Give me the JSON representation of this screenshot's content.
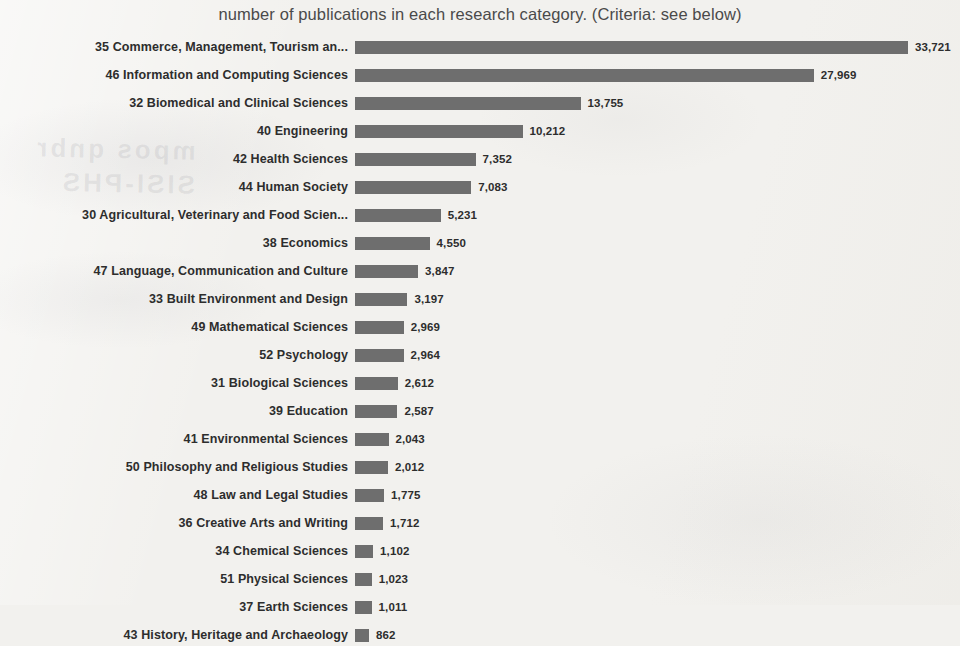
{
  "chart_data": {
    "type": "bar",
    "orientation": "horizontal",
    "title": "number of publications in each research category. (Criteria: see below)",
    "xlabel": "",
    "ylabel": "",
    "grid": false,
    "legend": null,
    "xlim": [
      0,
      33721
    ],
    "bar_color": "#6e6e6e",
    "background_color": "#f2f1ee",
    "text_color": "#2d2d2d",
    "sorted": "descending",
    "categories": [
      "35 Commerce, Management, Tourism an...",
      "46 Information and Computing Sciences",
      "32 Biomedical and Clinical Sciences",
      "40 Engineering",
      "42 Health Sciences",
      "44 Human Society",
      "30 Agricultural, Veterinary and Food Scien...",
      "38 Economics",
      "47 Language, Communication and Culture",
      "33 Built Environment and Design",
      "49 Mathematical Sciences",
      "52 Psychology",
      "31 Biological Sciences",
      "39 Education",
      "41 Environmental Sciences",
      "50 Philosophy and Religious Studies",
      "48 Law and Legal Studies",
      "36 Creative Arts and Writing",
      "34 Chemical Sciences",
      "51 Physical Sciences",
      "37 Earth Sciences",
      "43 History, Heritage and Archaeology"
    ],
    "values": [
      33721,
      27969,
      13755,
      10212,
      7352,
      7083,
      5231,
      4550,
      3847,
      3197,
      2969,
      2964,
      2612,
      2587,
      2043,
      2012,
      1775,
      1712,
      1102,
      1023,
      1011,
      862
    ],
    "value_labels": [
      "33,721",
      "27,969",
      "13,755",
      "10,212",
      "7,352",
      "7,083",
      "5,231",
      "4,550",
      "3,847",
      "3,197",
      "2,969",
      "2,964",
      "2,612",
      "2,587",
      "2,043",
      "2,012",
      "1,775",
      "1,712",
      "1,102",
      "1,023",
      "1,011",
      "862"
    ]
  },
  "artifacts": {
    "ghost_text_line1": "mpos qnbr",
    "ghost_text_line2": "SISI-PHS"
  }
}
